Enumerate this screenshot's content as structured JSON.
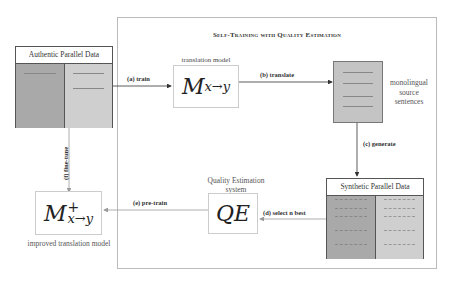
{
  "diagram": {
    "title": "Self-Training with Quality Estimation",
    "nodes": {
      "authentic_data": {
        "label": "Authentic Parallel Data"
      },
      "translation_model": {
        "caption": "translation model",
        "symbol": "M",
        "subscript": "x→y"
      },
      "monolingual": {
        "caption_lines": [
          "monolingual",
          "source",
          "sentences"
        ]
      },
      "synthetic_data": {
        "label": "Synthetic Parallel Data"
      },
      "qe_system": {
        "caption_lines": [
          "Quality Estimation",
          "system"
        ],
        "symbol": "QE"
      },
      "improved_model": {
        "caption": "improved translation model",
        "symbol": "M",
        "superscript": "+",
        "subscript": "x→y"
      }
    },
    "edges": [
      {
        "id": "a",
        "label": "(a) train",
        "from": "authentic_data",
        "to": "translation_model"
      },
      {
        "id": "b",
        "label": "(b) translate",
        "from": "translation_model",
        "to": "monolingual"
      },
      {
        "id": "c",
        "label": "(c) generate",
        "from": "monolingual",
        "to": "synthetic_data"
      },
      {
        "id": "d",
        "label": "(d) select n best",
        "from": "synthetic_data",
        "to": "qe_system"
      },
      {
        "id": "e",
        "label": "(e) pre-train",
        "from": "qe_system",
        "to": "improved_model"
      },
      {
        "id": "f",
        "label": "(f) fine-tune",
        "from": "authentic_data",
        "to": "improved_model"
      }
    ],
    "colors": {
      "dark_fill": "#a9a9a9",
      "light_fill": "#cfcfcf",
      "line": "#555555",
      "faint_line": "#999999"
    }
  }
}
